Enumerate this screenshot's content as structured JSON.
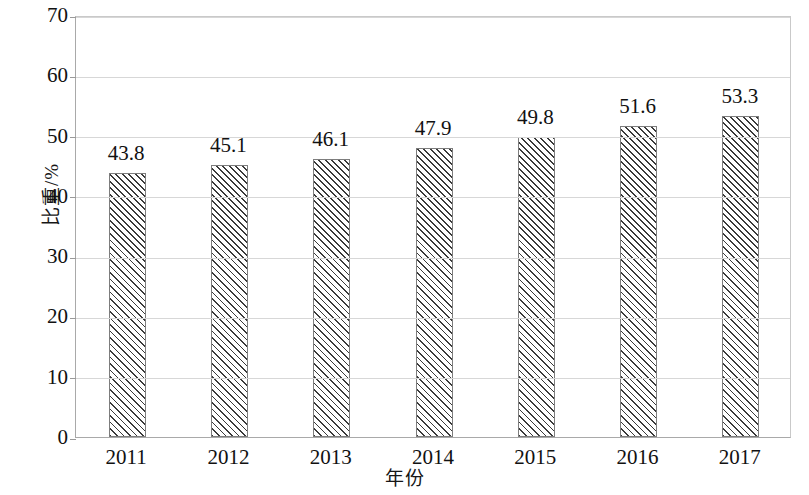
{
  "chart_data": {
    "type": "bar",
    "title": "",
    "subtitle": "",
    "xlabel": "年份",
    "ylabel": "比重/%",
    "categories": [
      "2011",
      "2012",
      "2013",
      "2014",
      "2015",
      "2016",
      "2017"
    ],
    "values": [
      43.8,
      45.1,
      46.1,
      47.9,
      49.8,
      51.6,
      53.3
    ],
    "value_labels": [
      "43.8",
      "45.1",
      "46.1",
      "47.9",
      "49.8",
      "51.6",
      "53.3"
    ],
    "ylim": [
      0,
      70
    ],
    "ytick_values": [
      0,
      10,
      20,
      30,
      40,
      50,
      60,
      70
    ],
    "ytick_labels": [
      "0",
      "10",
      "20",
      "30",
      "40",
      "50",
      "60",
      "70"
    ],
    "grid": true,
    "grid_axis": "y",
    "legend": false,
    "legend_position": "none",
    "series": [
      {
        "name": "比重",
        "values": [
          43.8,
          45.1,
          46.1,
          47.9,
          49.8,
          51.6,
          53.3
        ],
        "fill": "diagonal-hatch",
        "hatch_color": "#3a3a3a",
        "bar_color": "#ffffff",
        "border_color": "#7d7d7d"
      }
    ],
    "colors": {
      "background": "#ffffff",
      "gridline": "#d7d7d7",
      "axis": "#a9a9a9",
      "text": "#111111",
      "hatch": "#3a3a3a"
    },
    "annotations": []
  }
}
